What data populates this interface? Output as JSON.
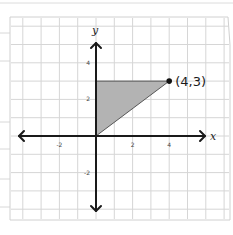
{
  "diagram": {
    "type": "coordinate-plane",
    "background": "graph paper",
    "axes": {
      "x_label": "x",
      "y_label": "y",
      "x_ticks": [
        {
          "value": -2,
          "label": "-2"
        },
        {
          "value": 2,
          "label": "2"
        },
        {
          "value": 4,
          "label": "4"
        }
      ],
      "y_ticks": [
        {
          "value": 4,
          "label": "4"
        },
        {
          "value": 2,
          "label": "2"
        },
        {
          "value": -2,
          "label": "-2"
        }
      ]
    },
    "point": {
      "x": 4,
      "y": 3,
      "label": "(4,3)"
    },
    "shaded_triangle": {
      "vertices": [
        [
          0,
          0
        ],
        [
          0,
          3
        ],
        [
          4,
          3
        ]
      ],
      "fill": "#b3b3b3"
    },
    "colors": {
      "grid": "#d6d6d6",
      "axis": "#1a1a1a",
      "paper_edge": "#c8c8c8"
    }
  }
}
